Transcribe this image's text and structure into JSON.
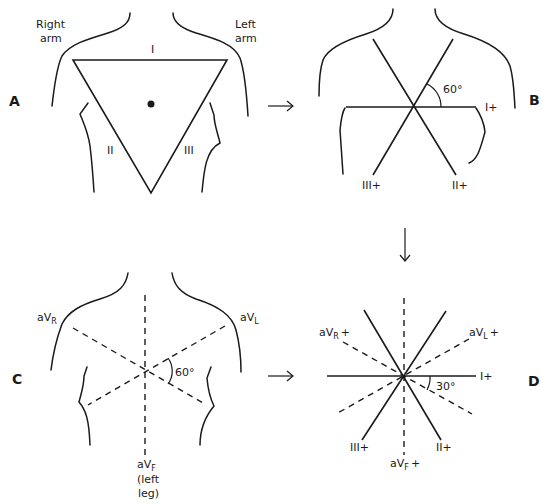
{
  "figure": {
    "panels": {
      "A": {
        "letter": "A",
        "right_arm_label_1": "Right",
        "right_arm_label_2": "arm",
        "left_arm_label_1": "Left",
        "left_arm_label_2": "arm",
        "lead_I": "I",
        "lead_II": "II",
        "lead_III": "III"
      },
      "B": {
        "letter": "B",
        "angle": "60°",
        "lead_I_pos": "I+",
        "lead_II_pos": "II+",
        "lead_III_pos": "III+"
      },
      "C": {
        "letter": "C",
        "aVR": "aV",
        "aVR_sub": "R",
        "aVL": "aV",
        "aVL_sub": "L",
        "aVF": "aV",
        "aVF_sub": "F",
        "left_leg_1": "(left",
        "left_leg_2": "leg)",
        "angle": "60°"
      },
      "D": {
        "letter": "D",
        "angle": "30°",
        "aVR_pos": "aV",
        "aVR_pos_sub": "R",
        "aVR_plus": "+",
        "aVL_pos": "aV",
        "aVL_pos_sub": "L",
        "aVL_plus": "+",
        "aVF_pos": "aV",
        "aVF_pos_sub": "F",
        "aVF_plus": "+",
        "lead_I_pos": "I+",
        "lead_II_pos": "II+",
        "lead_III_pos": "III+"
      }
    },
    "colors": {
      "ink": "#1a1a1a",
      "background": "#ffffff"
    }
  }
}
